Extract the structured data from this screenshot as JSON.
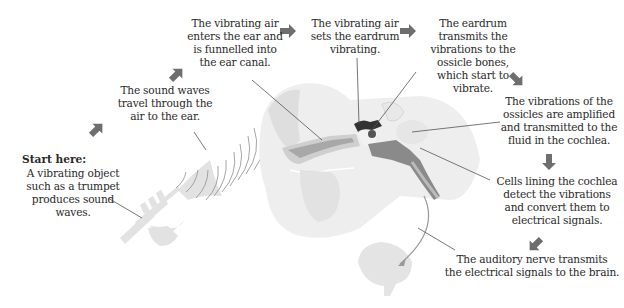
{
  "diagram": {
    "start_label": "Start here:",
    "steps": [
      {
        "id": "trumpet",
        "text": "A vibrating object\nsuch as a trumpet\nproduces sound\nwaves."
      },
      {
        "id": "sound-waves",
        "text": "The sound waves\ntravel through the\nair to the ear."
      },
      {
        "id": "ear-canal",
        "text": "The vibrating air\nenters the ear and\nis funnelled into\nthe ear canal."
      },
      {
        "id": "eardrum",
        "text": "The vibrating air\nsets the eardrum\nvibrating."
      },
      {
        "id": "ossicles",
        "text": "The eardrum\ntransmits the\nvibrations to the\nossicle bones,\nwhich start to\nvibrate."
      },
      {
        "id": "cochlea-fluid",
        "text": "The vibrations of the\nossicles are amplified\nand transmitted to the\nfluid in the cochlea."
      },
      {
        "id": "cochlea-cells",
        "text": "Cells lining the cochlea\ndetect the vibrations\nand convert them to\nelectrical signals."
      },
      {
        "id": "auditory-nerve",
        "text": "The auditory nerve transmits\nthe electrical signals to the brain."
      }
    ],
    "colors": {
      "arrow": "#6e6e6e",
      "illustration_light": "#e4e4e4",
      "illustration_mid": "#c9c9c9",
      "illustration_dark": "#8a8a8a",
      "ossicles": "#333333",
      "text": "#2a2a2a",
      "leader_line": "#555555"
    }
  }
}
